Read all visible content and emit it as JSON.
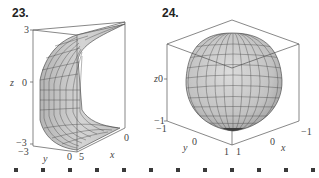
{
  "figures": [
    {
      "number": "23.",
      "surface": "quarter-cylinder-shell",
      "axes": {
        "z_label": "z",
        "y_label": "y",
        "x_label": "x",
        "z_ticks": [
          "3",
          "0",
          "−3"
        ],
        "y_ticks": [
          "−3",
          "0"
        ],
        "x_ticks": [
          "5",
          "0"
        ]
      }
    },
    {
      "number": "24.",
      "surface": "sphere-like-blob",
      "axes": {
        "z_label": "z",
        "y_label": "y",
        "x_label": "x",
        "z_ticks": [
          "0",
          "−1"
        ],
        "y_ticks": [
          "−1",
          "0",
          "1"
        ],
        "x_ticks": [
          "1",
          "0",
          "−1"
        ]
      }
    }
  ],
  "bullet_count": 12,
  "colors": {
    "surface_fill": "#c8c8c8",
    "mesh_line": "#3c3c3c",
    "box_line": "#555555",
    "text": "#333333"
  }
}
